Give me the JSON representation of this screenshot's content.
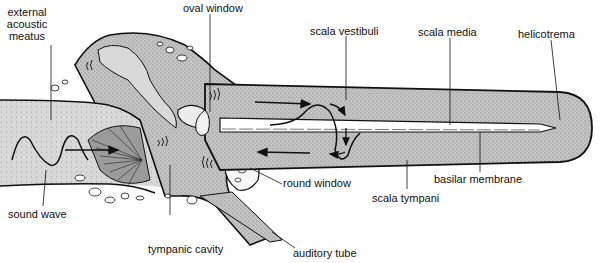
{
  "colors": {
    "fluid": "#bdbdbd",
    "fluid_dark": "#9a9a9a",
    "outline": "#111111",
    "bone": "#f4f4f4",
    "membrane": "#ffffff"
  },
  "labels": {
    "external_acoustic_meatus": [
      "external",
      "acoustic",
      "meatus"
    ],
    "oval_window": "oval window",
    "scala_vestibuli": "scala vestibuli",
    "scala_media": "scala media",
    "helicotrema": "helicotrema",
    "sound_wave": "sound wave",
    "round_window": "round window",
    "basilar_membrane": "basilar membrane",
    "scala_tympani": "scala tympani",
    "tympanic_cavity": "tympanic cavity",
    "auditory_tube": "auditory tube"
  }
}
